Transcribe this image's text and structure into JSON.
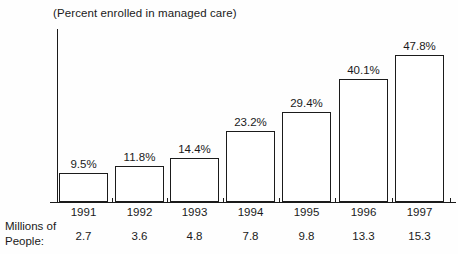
{
  "chart_data": {
    "type": "bar",
    "title": "(Percent enrolled in managed care)",
    "xlabel": "",
    "ylabel": "",
    "ylim": [
      0,
      55
    ],
    "grid": false,
    "legend": "none",
    "categories": [
      "1991",
      "1992",
      "1993",
      "1994",
      "1995",
      "1996",
      "1997"
    ],
    "values": [
      9.5,
      11.8,
      14.4,
      23.2,
      29.4,
      40.1,
      47.8
    ],
    "value_labels": [
      "9.5%",
      "11.8%",
      "14.4%",
      "23.2%",
      "29.4%",
      "40.1%",
      "47.8%"
    ],
    "secondary_axis": {
      "label_line1": "Millions of",
      "label_line2": "People:",
      "values": [
        2.7,
        3.6,
        4.8,
        7.8,
        9.8,
        13.3,
        15.3
      ],
      "value_labels": [
        "2.7",
        "3.6",
        "4.8",
        "7.8",
        "9.8",
        "13.3",
        "15.3"
      ]
    },
    "colors": {
      "bar_fill": "#ffffff",
      "bar_stroke": "#1b1b1b",
      "axis": "#1b1b1b",
      "text": "#1a1a1a",
      "background": "#fefefe"
    }
  }
}
